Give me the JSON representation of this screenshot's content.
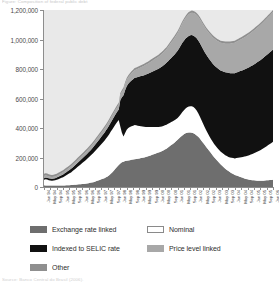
{
  "caption_top": "Figure: Composition of federal public debt",
  "caption_bottom": "Source: Banco Central do Brasil (2006).",
  "legend": {
    "items": [
      {
        "label": "Exchange rate linked",
        "color": "#6e6e6e",
        "bordered": false,
        "col": 0,
        "row": 0
      },
      {
        "label": "Nominal",
        "color": "#ffffff",
        "bordered": true,
        "col": 1,
        "row": 0
      },
      {
        "label": "Indexed to SELIC rate",
        "color": "#111111",
        "bordered": false,
        "col": 0,
        "row": 1
      },
      {
        "label": "Price level linked",
        "color": "#a8a8a8",
        "bordered": false,
        "col": 1,
        "row": 1
      },
      {
        "label": "Other",
        "color": "#8f8f8f",
        "bordered": false,
        "col": 0,
        "row": 2
      }
    ]
  },
  "chart_data": {
    "type": "area",
    "stacked": true,
    "title": "",
    "subtitle": "",
    "xlabel": "",
    "ylabel": "",
    "grid": false,
    "plot_background": "#e9e9e9",
    "legend_position": "bottom",
    "ylim": [
      0,
      1200000
    ],
    "ytick_values": [
      0,
      200000,
      400000,
      600000,
      800000,
      1000000,
      1200000
    ],
    "ytick_labels": [
      "0",
      "200,000",
      "400,000",
      "600,000",
      "800,000",
      "1,000,000",
      "1,200,000"
    ],
    "x_tick_labels": [
      "Jan 94",
      "May 94",
      "Sep 94",
      "Jan 95",
      "May 95",
      "Sep 95",
      "Jan 96",
      "May 96",
      "Sep 96",
      "Jan 97",
      "May 97",
      "Sep 97",
      "Jan 98",
      "May 98",
      "Sep 98",
      "Jan 99",
      "May 99",
      "Sep 99",
      "Jan 00",
      "May 00",
      "Sep 00",
      "Jan 01",
      "May 01",
      "Sep 01",
      "Jan 02",
      "May 02",
      "Sep 02",
      "Jan 03",
      "May 03",
      "Sep 03",
      "Jan 04",
      "May 04",
      "Sep 04",
      "Jan 05",
      "May 05",
      "Sep 05",
      "Jan 06"
    ],
    "x_label_interval_months": 4,
    "x_start": "Jan 94",
    "x_end": "Jan 06",
    "series": [
      {
        "name": "Exchange rate linked",
        "color": "#6e6e6e",
        "order": 0,
        "values": [
          12000,
          11000,
          10500,
          10000,
          9800,
          9600,
          9500,
          9400,
          9600,
          9800,
          10000,
          10200,
          10500,
          11000,
          11500,
          12000,
          12500,
          13000,
          14000,
          15000,
          16000,
          17000,
          18000,
          19000,
          20000,
          21000,
          22000,
          24000,
          26000,
          28000,
          30000,
          33000,
          36000,
          40000,
          44000,
          48000,
          52000,
          56000,
          60000,
          66000,
          72000,
          80000,
          90000,
          100000,
          112000,
          125000,
          138000,
          150000,
          160000,
          168000,
          172000,
          176000,
          178000,
          180000,
          182000,
          184000,
          186000,
          188000,
          190000,
          192000,
          194000,
          196000,
          198000,
          200000,
          203000,
          206000,
          210000,
          214000,
          218000,
          222000,
          226000,
          230000,
          234000,
          238000,
          242000,
          248000,
          254000,
          260000,
          268000,
          276000,
          284000,
          292000,
          300000,
          310000,
          320000,
          330000,
          340000,
          350000,
          358000,
          364000,
          368000,
          370000,
          370000,
          368000,
          364000,
          358000,
          350000,
          340000,
          328000,
          314000,
          300000,
          286000,
          272000,
          258000,
          244000,
          230000,
          216000,
          202000,
          190000,
          178000,
          166000,
          154000,
          144000,
          134000,
          124000,
          116000,
          108000,
          100000,
          94000,
          88000,
          82000,
          78000,
          74000,
          70000,
          66000,
          62000,
          58000,
          55000,
          52000,
          50000,
          48000,
          46000,
          45000,
          44000,
          43000,
          42000,
          42000,
          42000,
          43000,
          44000,
          45000,
          46000,
          47000,
          48000,
          50000
        ]
      },
      {
        "name": "Nominal",
        "color": "#ffffff",
        "order": 1,
        "values": [
          38000,
          42000,
          40000,
          36000,
          34000,
          33000,
          34000,
          36000,
          39000,
          43000,
          47000,
          52000,
          56000,
          62000,
          68000,
          74000,
          80000,
          86000,
          94000,
          102000,
          110000,
          118000,
          126000,
          134000,
          142000,
          150000,
          158000,
          166000,
          174000,
          182000,
          190000,
          198000,
          206000,
          214000,
          222000,
          230000,
          238000,
          246000,
          254000,
          262000,
          270000,
          278000,
          286000,
          292000,
          296000,
          300000,
          302000,
          304000,
          250000,
          200000,
          170000,
          190000,
          210000,
          220000,
          225000,
          228000,
          230000,
          232000,
          228000,
          224000,
          220000,
          216000,
          212000,
          208000,
          204000,
          200000,
          196000,
          192000,
          188000,
          184000,
          180000,
          176000,
          172000,
          170000,
          168000,
          166000,
          164000,
          162000,
          160000,
          158000,
          156000,
          154000,
          152000,
          150000,
          148000,
          150000,
          154000,
          158000,
          162000,
          168000,
          172000,
          176000,
          178000,
          180000,
          178000,
          174000,
          168000,
          160000,
          150000,
          140000,
          130000,
          120000,
          112000,
          106000,
          100000,
          96000,
          92000,
          90000,
          88000,
          86000,
          86000,
          86000,
          88000,
          90000,
          92000,
          94000,
          96000,
          100000,
          104000,
          108000,
          112000,
          118000,
          124000,
          130000,
          136000,
          142000,
          148000,
          154000,
          160000,
          166000,
          172000,
          178000,
          184000,
          190000,
          196000,
          202000,
          208000,
          214000,
          220000,
          226000,
          232000,
          238000,
          244000,
          250000,
          256000
        ]
      },
      {
        "name": "Indexed to SELIC rate",
        "color": "#111111",
        "order": 2,
        "values": [
          10000,
          11000,
          12000,
          12500,
          13000,
          13500,
          14000,
          14500,
          15000,
          16000,
          17000,
          18000,
          19000,
          20000,
          21000,
          22000,
          23000,
          24000,
          25000,
          26000,
          27000,
          28000,
          29000,
          30000,
          31000,
          32000,
          33000,
          34000,
          35000,
          36000,
          38000,
          40000,
          42000,
          44000,
          46000,
          48000,
          50000,
          52000,
          54000,
          56000,
          58000,
          60000,
          62000,
          64000,
          66000,
          68000,
          70000,
          72000,
          180000,
          240000,
          280000,
          290000,
          295000,
          300000,
          305000,
          310000,
          315000,
          320000,
          325000,
          330000,
          335000,
          340000,
          345000,
          350000,
          355000,
          360000,
          365000,
          370000,
          375000,
          380000,
          385000,
          390000,
          395000,
          400000,
          405000,
          410000,
          415000,
          420000,
          425000,
          430000,
          435000,
          440000,
          445000,
          450000,
          455000,
          460000,
          465000,
          470000,
          472000,
          474000,
          476000,
          478000,
          480000,
          482000,
          484000,
          486000,
          490000,
          494000,
          498000,
          502000,
          506000,
          510000,
          514000,
          518000,
          522000,
          526000,
          530000,
          534000,
          538000,
          542000,
          546000,
          550000,
          554000,
          558000,
          562000,
          566000,
          570000,
          572000,
          574000,
          576000,
          578000,
          580000,
          582000,
          584000,
          586000,
          588000,
          590000,
          592000,
          594000,
          596000,
          598000,
          600000,
          602000,
          604000,
          606000,
          608000,
          610000,
          612000,
          614000,
          616000,
          618000,
          620000,
          622000,
          624000,
          626000
        ]
      },
      {
        "name": "Price level linked",
        "color": "#a8a8a8",
        "order": 3,
        "values": [
          14000,
          14000,
          13500,
          13000,
          12500,
          12000,
          12000,
          12000,
          12500,
          13000,
          13500,
          14000,
          14500,
          15000,
          15500,
          16000,
          16500,
          17000,
          17500,
          18000,
          18500,
          19000,
          19500,
          20000,
          20500,
          21000,
          21500,
          22000,
          22500,
          23000,
          23500,
          24000,
          24500,
          25000,
          25500,
          26000,
          26500,
          27000,
          27500,
          28000,
          28500,
          29000,
          29500,
          30000,
          30500,
          31000,
          31500,
          32000,
          34000,
          36000,
          38000,
          40000,
          42000,
          44000,
          46000,
          48000,
          50000,
          52000,
          54000,
          56000,
          58000,
          60000,
          62000,
          64000,
          66000,
          68000,
          70000,
          72000,
          74000,
          76000,
          78000,
          80000,
          82000,
          84000,
          86000,
          88000,
          90000,
          92000,
          96000,
          100000,
          104000,
          108000,
          112000,
          116000,
          120000,
          124000,
          128000,
          132000,
          136000,
          140000,
          144000,
          148000,
          150000,
          152000,
          154000,
          156000,
          158000,
          160000,
          162000,
          164000,
          166000,
          168000,
          170000,
          172000,
          174000,
          176000,
          178000,
          180000,
          182000,
          184000,
          186000,
          188000,
          190000,
          192000,
          194000,
          196000,
          198000,
          200000,
          202000,
          204000,
          206000,
          208000,
          210000,
          212000,
          214000,
          216000,
          218000,
          220000,
          222000,
          224000,
          226000,
          228000,
          230000,
          232000,
          234000,
          236000,
          238000,
          240000,
          242000,
          244000,
          246000,
          248000,
          250000,
          252000,
          254000
        ]
      },
      {
        "name": "Other",
        "color": "#8f8f8f",
        "order": 4,
        "values": [
          16000,
          16000,
          15500,
          15000,
          14500,
          14000,
          14000,
          14000,
          14000,
          14000,
          14000,
          14000,
          14000,
          14000,
          14000,
          14000,
          14000,
          14000,
          14000,
          14000,
          14000,
          14000,
          14000,
          14000,
          14000,
          14000,
          14000,
          14000,
          14000,
          14000,
          14000,
          14000,
          14000,
          14000,
          14000,
          14000,
          14000,
          14000,
          14000,
          14000,
          14000,
          14000,
          14000,
          14000,
          14000,
          14000,
          14000,
          14000,
          14000,
          14000,
          14000,
          14000,
          14000,
          14000,
          14000,
          14000,
          14000,
          14000,
          14000,
          14000,
          14000,
          14000,
          14000,
          14000,
          14000,
          14000,
          14000,
          14000,
          14000,
          14000,
          14000,
          14000,
          14000,
          14000,
          14000,
          14000,
          14000,
          14000,
          14000,
          14000,
          14000,
          14000,
          14000,
          14000,
          14000,
          14000,
          14000,
          14000,
          14000,
          14000,
          14000,
          14000,
          14000,
          14000,
          14000,
          14000,
          14000,
          14000,
          14000,
          14000,
          14000,
          14000,
          14000,
          14000,
          14000,
          14000,
          14000,
          14000,
          14000,
          14000,
          14000,
          14000,
          14000,
          14000,
          14000,
          14000,
          14000,
          14000,
          14000,
          14000,
          14000,
          14000,
          14000,
          14000,
          14000,
          14000,
          14000,
          14000,
          14000,
          14000,
          14000,
          14000,
          14000,
          14000,
          14000,
          14000,
          14000,
          14000,
          14000,
          14000,
          14000,
          14000,
          14000,
          14000,
          14000
        ]
      }
    ]
  }
}
